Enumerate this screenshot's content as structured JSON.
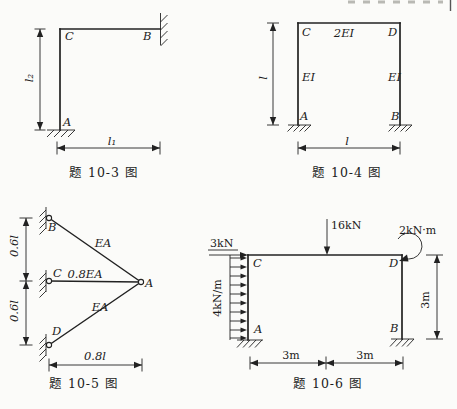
{
  "page": {
    "background": "#fbfbf9",
    "ink": "#222222"
  },
  "fig3": {
    "caption": "题 10-3 图",
    "nodes": {
      "C": "C",
      "B": "B",
      "A": "A"
    },
    "dims": {
      "vertical": "l₂",
      "horizontal": "l₁"
    }
  },
  "fig4": {
    "caption": "题 10-4 图",
    "nodes": {
      "C": "C",
      "D": "D",
      "A": "A",
      "B": "B"
    },
    "members": {
      "beam": "2EI",
      "left_column": "EI",
      "right_column": "EI"
    },
    "dims": {
      "vertical": "l",
      "horizontal": "l"
    }
  },
  "fig5": {
    "caption": "题 10-5 图",
    "nodes": {
      "B": "B",
      "C": "C",
      "D": "D",
      "A": "A"
    },
    "members": {
      "top_bar": "EA",
      "middle_bar": "0.8EA",
      "bottom_bar": "EA"
    },
    "dims": {
      "upper": "0.6l",
      "lower": "0.6l",
      "horizontal": "0.8l"
    }
  },
  "fig6": {
    "caption": "题 10-6 图",
    "nodes": {
      "C": "C",
      "D": "D",
      "A": "A",
      "B": "B"
    },
    "loads": {
      "horizontal": "3kN",
      "distributed": "4kN/m",
      "point": "16kN",
      "moment": "2kN·m"
    },
    "dims": {
      "right": "3m",
      "bottom_left": "3m",
      "bottom_right": "3m"
    }
  }
}
